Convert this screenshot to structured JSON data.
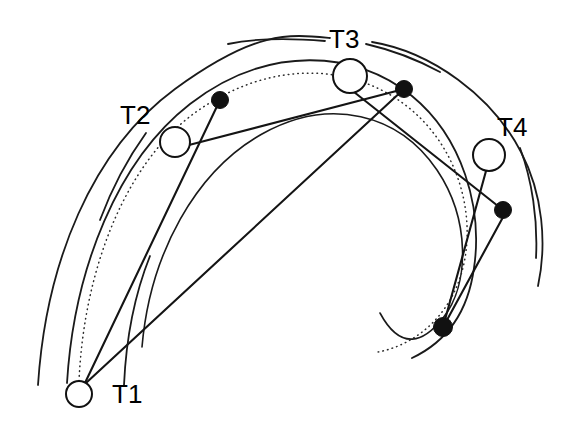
{
  "figure": {
    "kind": "orbital-spiral-diagram",
    "background_color": "#ffffff",
    "stroke_color": "#1a1a1a",
    "node_fill_open": "#ffffff",
    "node_fill_closed": "#111111",
    "width": 578,
    "height": 434
  },
  "labels": [
    {
      "id": "T1",
      "text": "T1",
      "x": 112,
      "y": 403
    },
    {
      "id": "T2",
      "text": "T2",
      "x": 120,
      "y": 124
    },
    {
      "id": "T3",
      "text": "T3",
      "x": 329,
      "y": 48
    },
    {
      "id": "T4",
      "text": "T4",
      "x": 497,
      "y": 136
    }
  ],
  "open_nodes": [
    {
      "id": "T1-open",
      "label": "T1",
      "cx": 79,
      "cy": 394,
      "r": 13
    },
    {
      "id": "T2-open",
      "label": "T2",
      "cx": 175,
      "cy": 142,
      "r": 15
    },
    {
      "id": "T3-open",
      "label": "T3",
      "cx": 350,
      "cy": 76,
      "r": 17
    },
    {
      "id": "T4-open",
      "label": "T4",
      "cx": 489,
      "cy": 155,
      "r": 16
    }
  ],
  "filled_nodes": [
    {
      "id": "dot-T2",
      "near": "T2",
      "cx": 220,
      "cy": 100,
      "r": 8.5
    },
    {
      "id": "dot-T3",
      "near": "T3",
      "cx": 404,
      "cy": 89,
      "r": 8.5
    },
    {
      "id": "dot-T4",
      "near": "T4",
      "cx": 503,
      "cy": 210,
      "r": 8.5
    },
    {
      "id": "dot-lower",
      "near": "T4",
      "cx": 443,
      "cy": 327,
      "r": 9.5
    }
  ],
  "curves": {
    "outer_arc": "M 38 385 C 46 262 92 150 175 89 C 256 30 289 34 330 38",
    "outer_arc_right": "M 372 42 C 432 52 492 96 521 152 C 543 194 547 244 538 286",
    "inner_arc": "M 67 383 C 74 268 118 160 190 104 C 268 44 356 50 412 96 C 462 137 483 207 474 268 C 468 312 446 342 412 358",
    "mid_arc": "M 142 347 C 150 253 196 171 262 134 C 330 96 399 114 437 170 C 470 219 470 284 443 318 C 424 342 401 352 380 313",
    "dotted_spiral": "M 79 381 C 84 268 126 162 196 112 C 274 57 353 66 404 104 C 455 142 474 206 465 258 C 456 310 420 344 378 352"
  },
  "chords": [
    {
      "id": "chord-T1-to-T3dot",
      "from": "T1-open",
      "to": "dot-T3",
      "d": "M 86 383 L 404 89"
    },
    {
      "id": "chord-T1-to-T2dot",
      "from": "T1-open",
      "to": "dot-T2",
      "d": "M 84 385 L 220 100"
    },
    {
      "id": "chord-T2-to-T3dot",
      "from": "T2-open",
      "to": "dot-T3",
      "d": "M 189 145 L 404 89"
    },
    {
      "id": "chord-T3-to-T4dot",
      "from": "T3-open",
      "to": "dot-T4",
      "d": "M 354 92 L 503 210"
    },
    {
      "id": "chord-T4-to-lowerdot",
      "from": "T4-open",
      "to": "dot-lower",
      "d": "M 486 171 L 443 327"
    },
    {
      "id": "chord-T4dot-to-lowerdot",
      "from": "dot-T4",
      "to": "dot-lower",
      "d": "M 502 219 L 447 320"
    }
  ],
  "leaders": [
    {
      "id": "leader-T1",
      "for": "T1",
      "d": "M 124 385 C 126 340 134 296 150 256"
    },
    {
      "id": "leader-T2",
      "for": "T2",
      "d": "M 146 133 C 128 158 112 188 100 220"
    },
    {
      "id": "leader-T3-left",
      "for": "T3",
      "d": "M 325 41 C 290 38 256 38 228 44"
    },
    {
      "id": "leader-T3-right",
      "for": "T3",
      "d": "M 366 44 C 392 50 418 60 440 72"
    },
    {
      "id": "leader-T4",
      "for": "T4",
      "d": "M 520 148 C 532 180 538 220 536 258"
    }
  ]
}
